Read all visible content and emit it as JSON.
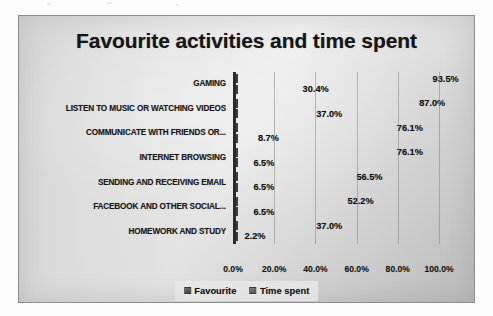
{
  "chart_data": {
    "type": "bar",
    "orientation": "horizontal",
    "title": "Favourite activities and time spent",
    "xlabel": "",
    "ylabel": "",
    "xlim": [
      0,
      100
    ],
    "xticks": [
      "0.0%",
      "20.0%",
      "40.0%",
      "60.0%",
      "80.0%",
      "100.0%"
    ],
    "xtick_values": [
      0,
      20,
      40,
      60,
      80,
      100
    ],
    "grid": true,
    "grid_axis": "x",
    "legend_position": "bottom",
    "categories": [
      "GAMING",
      "LISTEN TO MUSIC OR WATCHING VIDEOS",
      "COMMUNICATE WITH FRIENDS OR...",
      "INTERNET BROWSING",
      "SENDING AND RECEIVING EMAIL",
      "FACEBOOK AND OTHER SOCIAL...",
      "HOMEWORK AND STUDY"
    ],
    "series": [
      {
        "name": "Favourite",
        "key": "favourite",
        "color": "#4a4a4a",
        "values": [
          93.5,
          87.0,
          76.1,
          76.1,
          56.5,
          52.2,
          37.0
        ],
        "labels": [
          "93.5%",
          "87.0%",
          "76.1%",
          "76.1%",
          "56.5%",
          "52.2%",
          "37.0%"
        ]
      },
      {
        "name": "Time spent",
        "key": "timespent",
        "color": "#595959",
        "values": [
          30.4,
          37.0,
          8.7,
          6.5,
          6.5,
          6.5,
          2.2
        ],
        "labels": [
          "30.4%",
          "37.0%",
          "8.7%",
          "6.5%",
          "6.5%",
          "6.5%",
          "2.2%"
        ]
      }
    ]
  },
  "legend": {
    "items": [
      {
        "label": "Favourite",
        "key": "favourite"
      },
      {
        "label": "Time spent",
        "key": "timespent"
      }
    ]
  },
  "colors": {
    "plot_background_light": "#ededed",
    "plot_background_dark": "#c4c4c4",
    "axis_line": "#2b2b2b",
    "gridline": "#7d7d7d",
    "text": "#161616"
  }
}
